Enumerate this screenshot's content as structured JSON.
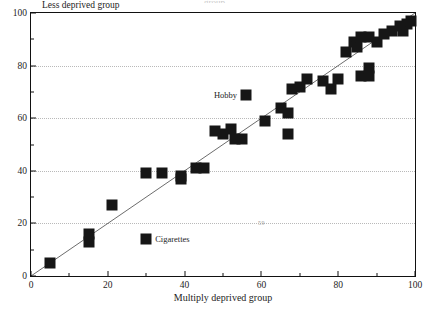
{
  "figure": {
    "cut_off_top_text": "group",
    "y_axis_caption": "Less deprived group",
    "xlabel": "Multiply deprived group",
    "page_artifact": "59"
  },
  "chart_data": {
    "type": "scatter",
    "title": "",
    "xlabel": "Multiply deprived group",
    "ylabel": "Less deprived group",
    "xlim": [
      0,
      100
    ],
    "ylim": [
      0,
      100
    ],
    "xticks": [
      0,
      20,
      40,
      60,
      80,
      100
    ],
    "yticks": [
      0,
      20,
      40,
      60,
      80,
      100
    ],
    "x_minor_ticks": [
      10,
      30,
      50,
      70,
      90
    ],
    "y_minor_ticks": [
      10,
      30,
      50,
      70,
      90
    ],
    "grid": "horizontal-dotted-major",
    "legend": "none",
    "marker": "filled-square",
    "marker_color": "#161616",
    "reference_line": {
      "label": "y = x",
      "from": [
        0,
        0
      ],
      "to": [
        100,
        100
      ],
      "color": "#111111"
    },
    "annotations": [
      {
        "text": "Hobby",
        "x": 56,
        "y": 69,
        "placement": "left"
      },
      {
        "text": "Cigarettes",
        "x": 30,
        "y": 14,
        "placement": "right"
      }
    ],
    "points": [
      {
        "x": 5,
        "y": 5
      },
      {
        "x": 15,
        "y": 16
      },
      {
        "x": 15,
        "y": 13
      },
      {
        "x": 21,
        "y": 27
      },
      {
        "x": 30,
        "y": 14
      },
      {
        "x": 30,
        "y": 39
      },
      {
        "x": 34,
        "y": 39
      },
      {
        "x": 39,
        "y": 38
      },
      {
        "x": 39,
        "y": 37
      },
      {
        "x": 43,
        "y": 41
      },
      {
        "x": 45,
        "y": 41
      },
      {
        "x": 48,
        "y": 55
      },
      {
        "x": 50,
        "y": 54
      },
      {
        "x": 52,
        "y": 56
      },
      {
        "x": 53,
        "y": 52
      },
      {
        "x": 55,
        "y": 52
      },
      {
        "x": 56,
        "y": 69
      },
      {
        "x": 61,
        "y": 59
      },
      {
        "x": 65,
        "y": 64
      },
      {
        "x": 67,
        "y": 62
      },
      {
        "x": 67,
        "y": 54
      },
      {
        "x": 68,
        "y": 71
      },
      {
        "x": 70,
        "y": 72
      },
      {
        "x": 72,
        "y": 75
      },
      {
        "x": 76,
        "y": 74
      },
      {
        "x": 78,
        "y": 71
      },
      {
        "x": 80,
        "y": 75
      },
      {
        "x": 82,
        "y": 85
      },
      {
        "x": 84,
        "y": 89
      },
      {
        "x": 85,
        "y": 87
      },
      {
        "x": 86,
        "y": 91
      },
      {
        "x": 86,
        "y": 76
      },
      {
        "x": 88,
        "y": 79
      },
      {
        "x": 88,
        "y": 76
      },
      {
        "x": 88,
        "y": 91
      },
      {
        "x": 90,
        "y": 89
      },
      {
        "x": 92,
        "y": 92
      },
      {
        "x": 94,
        "y": 93
      },
      {
        "x": 96,
        "y": 95
      },
      {
        "x": 97,
        "y": 93
      },
      {
        "x": 98,
        "y": 96
      },
      {
        "x": 99,
        "y": 97
      }
    ],
    "watermarks": [
      {
        "text": "59",
        "x": 60,
        "y": 20
      }
    ]
  }
}
